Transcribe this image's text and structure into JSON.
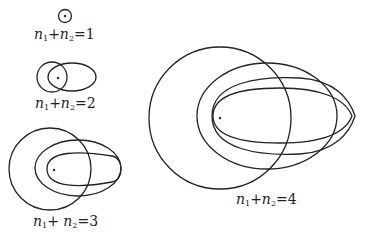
{
  "figure": {
    "colors": {
      "stroke": "#222222",
      "background": "#ffffff"
    },
    "groups": [
      {
        "label": {
          "var1": "n",
          "sub1": "1",
          "plus": "+",
          "var2": "n",
          "sub2": "2",
          "eq": "=",
          "value": "1"
        },
        "orbit_count": 1
      },
      {
        "label": {
          "var1": "n",
          "sub1": "1",
          "plus": "+",
          "var2": "n",
          "sub2": "2",
          "eq": "=",
          "value": "2"
        },
        "orbit_count": 2
      },
      {
        "label": {
          "var1": "n",
          "sub1": "1",
          "plus": "+ ",
          "var2": "n",
          "sub2": "2",
          "eq": "=",
          "value": "3"
        },
        "orbit_count": 3
      },
      {
        "label": {
          "var1": "n",
          "sub1": "1",
          "plus": "+",
          "var2": "n",
          "sub2": "2",
          "eq": "=",
          "value": "4"
        },
        "orbit_count": 4
      }
    ]
  }
}
